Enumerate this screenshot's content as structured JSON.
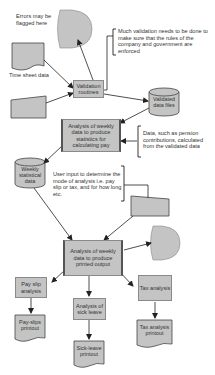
{
  "diagram": {
    "type": "flowchart",
    "colors": {
      "fill": "#c4c4c4",
      "stroke": "#555555",
      "text": "#333333",
      "background": "#ffffff"
    },
    "nodes": {
      "errors_display": {
        "shape": "display",
        "label": "Errors may be flagged here"
      },
      "time_sheet": {
        "shape": "document",
        "label": "Time sheet data"
      },
      "manual_input_1": {
        "shape": "manual-input",
        "label": ""
      },
      "validation": {
        "shape": "process",
        "label": "Validation routines"
      },
      "validation_note": {
        "shape": "annotation",
        "label": "Much validation needs to be done to make sure that the rules of the company and government are enforced"
      },
      "validated_files": {
        "shape": "database",
        "label": "Validated data files"
      },
      "analysis_pay": {
        "shape": "predefined-process",
        "label": "Analysis of weekly data to produce statistics for calculating pay"
      },
      "pension_note": {
        "shape": "annotation",
        "label": "Data, such as pension contributions, calculated from the validated data"
      },
      "weekly_stats": {
        "shape": "database",
        "label": "Weekly statistical data"
      },
      "user_input_note": {
        "shape": "annotation",
        "label": "User input to determine the mode of analysis i.e. pay slip or tax, and for how long etc."
      },
      "manual_input_2": {
        "shape": "manual-input",
        "label": ""
      },
      "analysis_print": {
        "shape": "predefined-process",
        "label": "Analysis of weekly data to produce printed output"
      },
      "display_2": {
        "shape": "display",
        "label": ""
      },
      "pay_slip_analysis": {
        "shape": "process",
        "label": "Pay slip analysis"
      },
      "sick_leave_analysis": {
        "shape": "process",
        "label": "Analysis of sick leave"
      },
      "tax_analysis": {
        "shape": "process",
        "label": "Tax analysis"
      },
      "pay_slips_printout": {
        "shape": "document",
        "label": "Pay-slips printout"
      },
      "sick_leave_printout": {
        "shape": "document",
        "label": "Sick-leave printout"
      },
      "tax_printout": {
        "shape": "document",
        "label": "Tax analysis printout"
      }
    },
    "edges": [
      [
        "time_sheet",
        "validation"
      ],
      [
        "manual_input_1",
        "validation"
      ],
      [
        "validation",
        "errors_display"
      ],
      [
        "validation",
        "validated_files"
      ],
      [
        "validated_files",
        "analysis_pay"
      ],
      [
        "pension_note",
        "analysis_pay"
      ],
      [
        "analysis_pay",
        "weekly_stats"
      ],
      [
        "weekly_stats",
        "analysis_print"
      ],
      [
        "manual_input_2",
        "analysis_print"
      ],
      [
        "analysis_print",
        "display_2"
      ],
      [
        "analysis_print",
        "pay_slip_analysis"
      ],
      [
        "analysis_print",
        "sick_leave_analysis"
      ],
      [
        "analysis_print",
        "tax_analysis"
      ],
      [
        "pay_slip_analysis",
        "pay_slips_printout"
      ],
      [
        "sick_leave_analysis",
        "sick_leave_printout"
      ],
      [
        "tax_analysis",
        "tax_printout"
      ]
    ]
  }
}
